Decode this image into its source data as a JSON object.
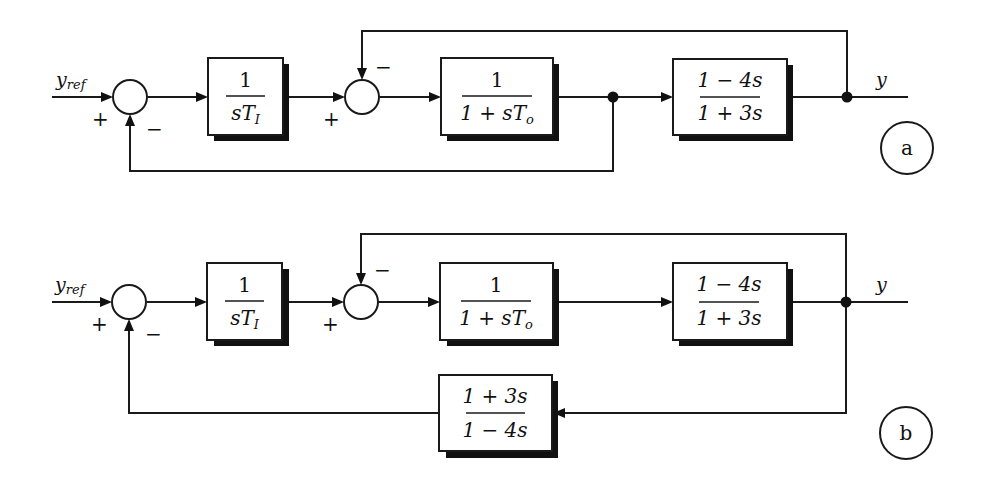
{
  "figure": {
    "diagrams": [
      {
        "id": "a",
        "label": "a",
        "input_label": "y",
        "input_subscript": "ref",
        "output_label": "y",
        "sum1_signs": {
          "left": "+",
          "bottom": "−"
        },
        "sum2_signs": {
          "left": "+",
          "top": "−"
        },
        "blocks": [
          {
            "name": "integrator",
            "num": "1",
            "den": "sT",
            "den_sub": "I"
          },
          {
            "name": "first-order-lag",
            "num": "1",
            "den": "1 + sT",
            "den_sub": "o"
          },
          {
            "name": "nonminimum-phase",
            "num": "1 − 4s",
            "den": "1 + 3s"
          }
        ],
        "feedback_description": "Inner loop: y fed back to second summing junction (−). Outer loop: output of 1/(1+sTo) fed back to first summing junction (−)."
      },
      {
        "id": "b",
        "label": "b",
        "input_label": "y",
        "input_subscript": "ref",
        "output_label": "y",
        "sum1_signs": {
          "left": "+",
          "bottom": "−"
        },
        "sum2_signs": {
          "left": "+",
          "top": "−"
        },
        "blocks": [
          {
            "name": "integrator",
            "num": "1",
            "den": "sT",
            "den_sub": "I"
          },
          {
            "name": "first-order-lag",
            "num": "1",
            "den": "1 + sT",
            "den_sub": "o"
          },
          {
            "name": "nonminimum-phase",
            "num": "1 − 4s",
            "den": "1 + 3s"
          }
        ],
        "feedback_block": {
          "name": "inverse-compensator",
          "num": "1 + 3s",
          "den": "1 − 4s"
        },
        "feedback_description": "Inner loop: y fed back to second summing junction (−). Outer loop: y passed through (1+3s)/(1−4s) back to first summing junction (−)."
      }
    ]
  }
}
